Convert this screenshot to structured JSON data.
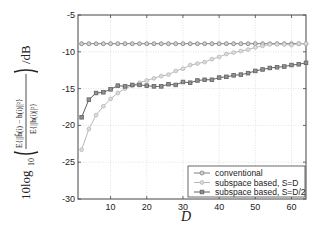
{
  "chart_data": {
    "type": "line",
    "title": "",
    "xlabel": "D",
    "ylabel": "10log10( E{||ĥ(i) − h(i)||²} / E{||h(i)||²} ) /dB",
    "xlim": [
      1,
      64
    ],
    "ylim": [
      -30,
      -5
    ],
    "xticks": [
      10,
      20,
      30,
      40,
      50,
      60
    ],
    "yticks": [
      -5,
      -10,
      -15,
      -20,
      -25,
      -30
    ],
    "grid": true,
    "legend_position": "lower right",
    "x": [
      2,
      4,
      6,
      8,
      10,
      12,
      14,
      16,
      18,
      20,
      22,
      24,
      26,
      28,
      30,
      32,
      34,
      36,
      38,
      40,
      42,
      44,
      46,
      48,
      50,
      52,
      54,
      56,
      58,
      60,
      62,
      64
    ],
    "series": [
      {
        "name": "conventional",
        "color": "#808080",
        "marker": "circle",
        "values": [
          -8.9,
          -8.9,
          -8.9,
          -8.9,
          -8.9,
          -8.9,
          -8.9,
          -8.9,
          -8.9,
          -8.9,
          -8.9,
          -8.9,
          -8.9,
          -8.9,
          -8.9,
          -8.9,
          -8.9,
          -8.9,
          -8.9,
          -8.9,
          -8.9,
          -8.9,
          -8.9,
          -8.9,
          -8.9,
          -8.9,
          -8.9,
          -8.9,
          -8.9,
          -8.9,
          -8.9,
          -8.9
        ]
      },
      {
        "name": "subspace based, S=D",
        "color": "#b8b8b8",
        "marker": "diamond",
        "values": [
          -23.3,
          -20.5,
          -18.6,
          -17.4,
          -16.4,
          -15.6,
          -15.0,
          -14.6,
          -14.2,
          -13.9,
          -13.6,
          -13.3,
          -13.1,
          -12.6,
          -12.3,
          -11.8,
          -11.6,
          -11.4,
          -11.0,
          -10.7,
          -10.3,
          -10.1,
          -9.9,
          -9.7,
          -9.4,
          -9.2,
          -9.0,
          -9.0,
          -9.0,
          -9.1,
          -8.9,
          -8.9
        ]
      },
      {
        "name": "subspace based, S=D/2",
        "color": "#606060",
        "marker": "square",
        "values": [
          -18.9,
          -16.5,
          -15.6,
          -15.5,
          -15.1,
          -14.6,
          -14.7,
          -14.5,
          -14.5,
          -14.6,
          -14.7,
          -14.7,
          -14.4,
          -14.5,
          -14.1,
          -14.2,
          -13.9,
          -13.8,
          -13.8,
          -13.5,
          -13.4,
          -13.2,
          -13.1,
          -12.9,
          -12.6,
          -12.4,
          -12.2,
          -12.1,
          -12.0,
          -11.8,
          -11.7,
          -11.5
        ]
      }
    ]
  },
  "axes": {
    "ylabel_prefix": "10log",
    "ylabel_sub": "10",
    "ylabel_unit": "/dB",
    "ylabel_num": "E{||ĥ(i) − h(i)||²}",
    "ylabel_den": "E{||h(i)||²}",
    "xlabel": "D",
    "yticklabels": [
      "-5",
      "-10",
      "-15",
      "-20",
      "-25",
      "-30"
    ],
    "xticklabels": [
      "10",
      "20",
      "30",
      "40",
      "50",
      "60"
    ]
  },
  "legend": {
    "items": [
      "conventional",
      "subspace based, S=D",
      "subspace based, S=D/2"
    ]
  }
}
